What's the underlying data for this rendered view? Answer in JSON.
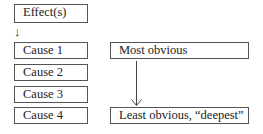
{
  "diagram": {
    "effect_box": {
      "label": "Effect(s)"
    },
    "small_arrow": "↓",
    "causes": [
      {
        "label": "Cause 1"
      },
      {
        "label": "Cause 2"
      },
      {
        "label": "Cause 3"
      },
      {
        "label": "Cause 4"
      }
    ],
    "scale": {
      "top_label": "Most obvious",
      "bottom_label": "Least obvious, “deepest”"
    }
  }
}
